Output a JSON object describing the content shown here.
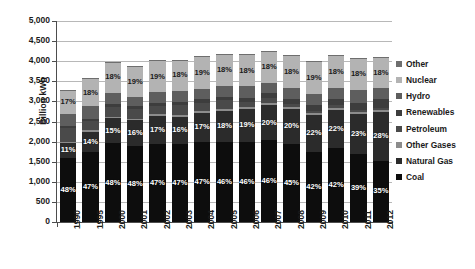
{
  "chart_data": {
    "type": "bar",
    "title": "",
    "subtitle": "",
    "xlabel": "",
    "ylabel": "Billion kWh",
    "ylim": [
      0,
      5000
    ],
    "ytick_step": 500,
    "ytick_labels": [
      "0",
      "500",
      "1,000",
      "1,500",
      "2,000",
      "2,500",
      "3,000",
      "3,500",
      "4,000",
      "4,500",
      "5,000"
    ],
    "grid": true,
    "stacked": true,
    "legend_position": "right",
    "categories": [
      "1990",
      "1995",
      "2000",
      "2001",
      "2002",
      "2003",
      "2004",
      "2005",
      "2006",
      "2007",
      "2008",
      "2009",
      "2010",
      "2011",
      "2012"
    ],
    "totals": [
      3330,
      3680,
      4090,
      3960,
      4120,
      4150,
      4240,
      4320,
      4330,
      4420,
      4330,
      4160,
      4370,
      4340,
      4360
    ],
    "series": [
      {
        "name": "Coal",
        "color": "#0d0d0d",
        "label_color": "#ffffff",
        "values": [
          1598,
          1730,
          1963,
          1901,
          1937,
          1951,
          1993,
          1987,
          1992,
          2033,
          1949,
          1747,
          1835,
          1693,
          1526
        ],
        "percent_labels": [
          "48%",
          "47%",
          "48%",
          "48%",
          "47%",
          "47%",
          "47%",
          "46%",
          "46%",
          "46%",
          "45%",
          "42%",
          "42%",
          "39%",
          "35%"
        ]
      },
      {
        "name": "Natural Gas",
        "color": "#2b2b2b",
        "label_color": "#ffffff",
        "values": [
          366,
          515,
          614,
          634,
          700,
          664,
          721,
          778,
          823,
          884,
          866,
          915,
          961,
          998,
          1221
        ],
        "percent_labels": [
          "11%",
          "14%",
          "15%",
          "16%",
          "17%",
          "16%",
          "17%",
          "18%",
          "19%",
          "20%",
          "20%",
          "22%",
          "22%",
          "23%",
          "28%"
        ]
      },
      {
        "name": "Other Gases",
        "color": "#8c8c8c",
        "label_color": "#ffffff",
        "values": [
          33,
          37,
          41,
          40,
          41,
          42,
          42,
          43,
          43,
          44,
          43,
          42,
          44,
          43,
          44
        ],
        "percent_labels": [
          "",
          "",
          "",
          "",
          "",
          "",
          "",
          "",
          "",
          "",
          "",
          "",
          "",
          "",
          ""
        ]
      },
      {
        "name": "Petroleum",
        "color": "#4a4a4a",
        "label_color": "#ffffff",
        "values": [
          333,
          221,
          245,
          238,
          206,
          249,
          212,
          216,
          130,
          133,
          87,
          62,
          61,
          43,
          39
        ],
        "percent_labels": [
          "",
          "",
          "",
          "",
          "",
          "",
          "",
          "",
          "",
          "",
          "",
          "",
          "",
          "",
          ""
        ]
      },
      {
        "name": "Renewables",
        "color": "#3d3d3d",
        "label_color": "#ffffff",
        "values": [
          65,
          72,
          80,
          71,
          79,
          82,
          85,
          87,
          96,
          105,
          126,
          144,
          168,
          195,
          219
        ],
        "percent_labels": [
          "",
          "",
          "",
          "",
          "",
          "",
          "",
          "",
          "",
          "",
          "",
          "",
          "",
          "",
          ""
        ]
      },
      {
        "name": "Hydro",
        "color": "#5e5e5e",
        "label_color": "#ffffff",
        "values": [
          293,
          311,
          276,
          217,
          264,
          276,
          268,
          270,
          289,
          248,
          255,
          273,
          260,
          319,
          277
        ],
        "percent_labels": [
          "",
          "",
          "",
          "",
          "",
          "",
          "",
          "",
          "",
          "",
          "",
          "",
          "",
          "",
          ""
        ]
      },
      {
        "name": "Nuclear",
        "color": "#b3b3b3",
        "label_color": "#1a1a1a",
        "values": [
          577,
          673,
          754,
          769,
          780,
          764,
          789,
          782,
          787,
          806,
          806,
          799,
          807,
          790,
          769
        ],
        "percent_labels": [
          "17%",
          "18%",
          "18%",
          "19%",
          "19%",
          "18%",
          "19%",
          "18%",
          "18%",
          "18%",
          "18%",
          "19%",
          "18%",
          "18%",
          "18%"
        ]
      },
      {
        "name": "Other",
        "color": "#6e6e6e",
        "label_color": "#ffffff",
        "values": [
          13,
          13,
          14,
          14,
          13,
          13,
          13,
          13,
          13,
          13,
          13,
          13,
          13,
          13,
          13
        ],
        "percent_labels": [
          "",
          "",
          "",
          "",
          "",
          "",
          "",
          "",
          "",
          "",
          "",
          "",
          "",
          "",
          ""
        ]
      }
    ],
    "legend_order": [
      "Other",
      "Nuclear",
      "Hydro",
      "Renewables",
      "Petroleum",
      "Other Gases",
      "Natural Gas",
      "Coal"
    ]
  },
  "axis": {
    "y_title": "Billion kWh"
  }
}
